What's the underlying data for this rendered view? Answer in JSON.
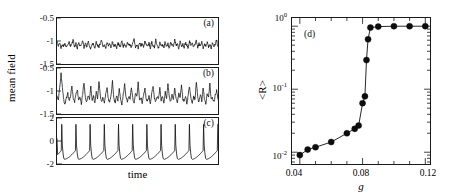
{
  "figure": {
    "caption_tags": [
      "(a)",
      "(b)",
      "(c)",
      "(d)"
    ]
  },
  "left_panels": {
    "ylabel": "mean field",
    "xlabel": "time",
    "panels": [
      {
        "tag": "(a)",
        "yticks": [
          "-0.5",
          "-1",
          "-1.5"
        ],
        "ylim": [
          -1.5,
          -0.5
        ],
        "description": "small-amplitude irregular noisy fluctuations around -1.1"
      },
      {
        "tag": "(b)",
        "yticks": [
          "-0.5",
          "-1",
          "-1.5"
        ],
        "ylim": [
          -1.5,
          -0.5
        ],
        "description": "intermittent larger irregular spikes around a -1.1 baseline"
      },
      {
        "tag": "(c)",
        "yticks": [
          "2",
          "0",
          "-2"
        ],
        "ylim": [
          -2,
          2
        ],
        "description": "regular relaxation oscillation spikes, ~11 spikes"
      }
    ]
  },
  "chart_data": [
    {
      "type": "line",
      "panel": "(a)",
      "title": "",
      "xlabel": "time",
      "ylabel": "mean field",
      "ylim": [
        -1.5,
        -0.5
      ],
      "yticks": [
        -0.5,
        -1,
        -1.5
      ],
      "xticks": [],
      "grid": false,
      "series": [
        {
          "name": "mean field (a)",
          "values": [
            -1.02,
            -1.1,
            -1.05,
            -1.14,
            -1.07,
            -1.12,
            -1.04,
            -1.15,
            -1.08,
            -1.03,
            -1.12,
            -1.06,
            -0.97,
            -1.13,
            -1.05,
            -1.16,
            -1.02,
            -1.11,
            -1.07,
            -0.99,
            -1.14,
            -1.06,
            -1.13,
            -1.0,
            -1.1,
            -1.17,
            -1.05,
            -1.08,
            -1.15,
            -1.02,
            -1.09,
            -1.13,
            -1.04,
            -0.98,
            -1.12,
            -1.07,
            -1.15,
            -1.03,
            -1.1,
            -1.06,
            -1.14,
            -1.01,
            -1.11,
            -1.08,
            -1.16,
            -1.04,
            -1.09,
            -1.13,
            -0.99,
            -1.12,
            -1.06,
            -1.15,
            -1.02,
            -1.1,
            -1.07,
            -1.14,
            -1.05,
            -0.96,
            -1.13,
            -1.09,
            -1.16,
            -1.03,
            -1.11,
            -1.06,
            -1.14,
            -1.0,
            -1.08,
            -1.12,
            -1.05,
            -1.15,
            -1.02,
            -1.1,
            -1.13,
            -0.98,
            -1.07,
            -1.16,
            -1.04,
            -1.11,
            -1.09,
            -1.14,
            -1.01,
            -1.12,
            -1.06,
            -1.15,
            -1.03,
            -1.08,
            -1.13,
            -0.97,
            -1.1,
            -1.05,
            -1.16,
            -1.02,
            -1.12,
            -1.07,
            -1.14,
            -1.04,
            -1.09,
            -1.15,
            -1.0,
            -1.11,
            -1.06,
            -1.13,
            -1.08,
            -0.99,
            -1.14,
            -1.05,
            -1.12,
            -1.03,
            -1.16,
            -1.07,
            -1.1,
            -1.02,
            -1.13,
            -1.08,
            -1.15,
            -1.04,
            -1.11,
            -1.06,
            -0.98,
            -1.12
          ]
        }
      ]
    },
    {
      "type": "line",
      "panel": "(b)",
      "title": "",
      "xlabel": "time",
      "ylabel": "mean field",
      "ylim": [
        -1.5,
        -0.5
      ],
      "yticks": [
        -0.5,
        -1,
        -1.5
      ],
      "xticks": [],
      "grid": false,
      "series": [
        {
          "name": "mean field (b)",
          "values": [
            -1.12,
            -1.18,
            -0.92,
            -0.62,
            -0.95,
            -1.2,
            -1.28,
            -1.15,
            -1.05,
            -1.22,
            -1.1,
            -0.88,
            -1.16,
            -1.25,
            -1.08,
            -0.97,
            -1.2,
            -1.12,
            -1.3,
            -1.05,
            -0.83,
            -1.14,
            -1.24,
            -1.09,
            -1.18,
            -0.9,
            -1.21,
            -1.12,
            -1.27,
            -1.02,
            -1.16,
            -0.8,
            -1.1,
            -1.22,
            -1.14,
            -1.28,
            -1.06,
            -0.93,
            -1.18,
            -1.24,
            -1.08,
            -0.78,
            -1.15,
            -1.26,
            -1.11,
            -1.2,
            -0.95,
            -1.17,
            -1.29,
            -1.07,
            -0.86,
            -1.13,
            -1.23,
            -1.1,
            -1.19,
            -0.91,
            -1.16,
            -1.27,
            -1.04,
            -1.12,
            -0.82,
            -1.2,
            -1.14,
            -1.25,
            -1.08,
            -0.96,
            -1.18,
            -1.22,
            -1.1,
            -1.3,
            -1.06,
            -0.89,
            -1.15,
            -1.24,
            -1.12,
            -1.19,
            -0.94,
            -1.21,
            -1.11,
            -1.28,
            -1.03,
            -1.16,
            -0.84,
            -1.13,
            -1.23,
            -1.09,
            -1.2,
            -0.92,
            -1.17,
            -1.26,
            -1.05,
            -1.14,
            -0.87,
            -1.18,
            -1.22,
            -1.1,
            -1.29,
            -1.07,
            -0.9,
            -1.15,
            -1.25,
            -1.12,
            -1.19,
            -0.79,
            -1.14,
            -1.24,
            -1.08,
            -1.21,
            -0.93,
            -1.17,
            -1.27,
            -1.06,
            -1.13,
            -0.85,
            -1.2,
            -1.15,
            -1.23,
            -1.09,
            -0.98,
            -1.18
          ]
        }
      ]
    },
    {
      "type": "line",
      "panel": "(c)",
      "title": "",
      "xlabel": "time",
      "ylabel": "mean field",
      "ylim": [
        -2,
        2
      ],
      "yticks": [
        2,
        0,
        -2
      ],
      "xticks": [],
      "grid": false,
      "spike_count": 11,
      "series": [
        {
          "name": "mean field (c)",
          "description": "periodic relaxation oscillations: fast upstroke to ~+1.4, rapid decay to ~-1.6, slow ramp back up"
        }
      ]
    },
    {
      "type": "line",
      "panel": "(d)",
      "title": "",
      "xlabel": "g",
      "ylabel": "<R>",
      "yscale": "log",
      "xlim": [
        0.035,
        0.123
      ],
      "ylim": [
        0.0065,
        1.35
      ],
      "xticks": [
        0.04,
        0.08,
        0.12
      ],
      "xticklabels": [
        "0.04",
        "0.08",
        "0.12"
      ],
      "yticks": [
        1,
        0.1,
        0.01
      ],
      "yticklabels": [
        "10⁰",
        "10⁻¹",
        "10⁻²"
      ],
      "grid": false,
      "marker": "filled-circle",
      "series": [
        {
          "name": "<R> vs g",
          "x": [
            0.04,
            0.045,
            0.05,
            0.06,
            0.07,
            0.075,
            0.0775,
            0.08,
            0.0815,
            0.0825,
            0.0835,
            0.085,
            0.09,
            0.1,
            0.11,
            0.12
          ],
          "y": [
            0.009,
            0.011,
            0.012,
            0.0145,
            0.02,
            0.0235,
            0.0265,
            0.06,
            0.077,
            0.29,
            0.62,
            0.95,
            0.985,
            1.0,
            1.0,
            1.0
          ]
        }
      ]
    }
  ],
  "right_panel": {
    "tag": "(d)",
    "xlabel": "g",
    "ylabel": "<R>",
    "xticklabels": [
      "0.04",
      "0.08",
      "0.12"
    ],
    "yticklabels": [
      "10",
      "10",
      "10"
    ],
    "yexponents": [
      "0",
      "-1",
      "-2"
    ]
  }
}
